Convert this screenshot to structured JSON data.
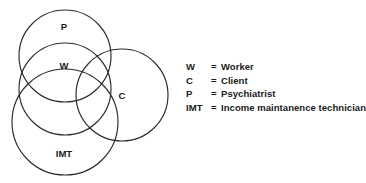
{
  "diagram": {
    "type": "venn",
    "title": "",
    "stroke_color": "#2b2b2b",
    "background_color": "#ffffff",
    "circles": [
      {
        "id": "P",
        "label": "P",
        "cx": 65,
        "cy": 56,
        "r": 46
      },
      {
        "id": "W",
        "label": "W",
        "cx": 65,
        "cy": 89,
        "r": 46
      },
      {
        "id": "IMT",
        "label": "IMT",
        "cx": 65,
        "cy": 122,
        "r": 53
      },
      {
        "id": "C",
        "label": "C",
        "cx": 122,
        "cy": 95,
        "r": 46
      }
    ],
    "labels": [
      {
        "text": "P",
        "x": 64,
        "y": 27
      },
      {
        "text": "W",
        "x": 64,
        "y": 66
      },
      {
        "text": "C",
        "x": 122,
        "y": 96
      },
      {
        "text": "IMT",
        "x": 64,
        "y": 154
      }
    ]
  },
  "legend": {
    "entries": [
      {
        "key": "W",
        "eq": "=",
        "value": "Worker"
      },
      {
        "key": "C",
        "eq": "=",
        "value": "Client"
      },
      {
        "key": "P",
        "eq": "=",
        "value": "Psychiatrist"
      },
      {
        "key": "IMT",
        "eq": "=",
        "value": "Income maintanence technician"
      }
    ]
  }
}
